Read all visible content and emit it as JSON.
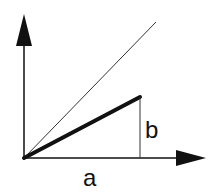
{
  "diagram": {
    "labels": {
      "horizontal": "a",
      "vertical": "b"
    },
    "colors": {
      "stroke": "#111111",
      "thin_line": "#333333",
      "background": "#ffffff"
    }
  }
}
